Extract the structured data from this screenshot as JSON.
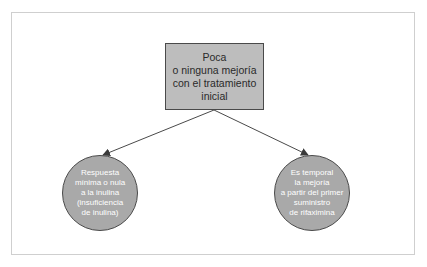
{
  "diagram": {
    "type": "tree",
    "root": {
      "lines": [
        "Poca",
        "o ninguna mejoría",
        "con el tratamiento",
        "inicial"
      ],
      "shape": "rectangle",
      "fill": "#bdbdbd"
    },
    "children": [
      {
        "lines": [
          "Respuesta",
          "mínima o nula",
          "a la inulina",
          "(insuficiencia",
          "de inulina)"
        ],
        "shape": "circle",
        "fill": "#a9a9a9"
      },
      {
        "lines": [
          "Es temporal",
          "la mejoría",
          "a partir del primer",
          "suministro",
          "de rifaximina"
        ],
        "shape": "circle",
        "fill": "#a9a9a9"
      }
    ],
    "edges": [
      {
        "from": "root",
        "to": "children.0",
        "arrow": true
      },
      {
        "from": "root",
        "to": "children.1",
        "arrow": true
      }
    ],
    "colors": {
      "frame_border": "#cfcfcf",
      "stroke": "#4a4a4a",
      "root_text": "#2a2a2a",
      "child_text": "#ffffff"
    }
  }
}
